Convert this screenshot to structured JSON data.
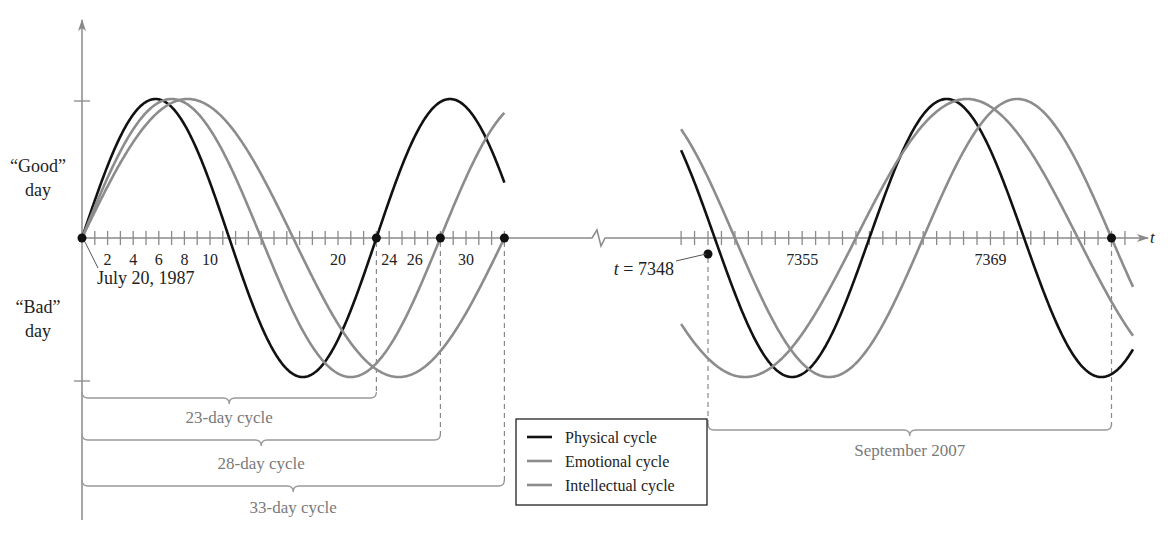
{
  "chart_data": {
    "type": "line",
    "title": "",
    "xlabel": "t",
    "ylabel_top": [
      "“Good”",
      "day"
    ],
    "ylabel_bottom": [
      "“Bad”",
      "day"
    ],
    "y_range": [
      -1,
      1
    ],
    "grid": false,
    "legend_position": "bottom-center",
    "colors": {
      "physical": "#111111",
      "emotional": "#8c8c8c",
      "intellectual": "#8c8c8c",
      "axis": "#8a8a8a"
    },
    "series": [
      {
        "name": "Physical cycle",
        "key": "physical",
        "period": 23,
        "formula": "sin(2*pi*t/23)"
      },
      {
        "name": "Emotional cycle",
        "key": "emotional",
        "period": 28,
        "formula": "sin(2*pi*t/28)"
      },
      {
        "name": "Intellectual cycle",
        "key": "intellectual",
        "period": 33,
        "formula": "sin(2*pi*t/33)"
      }
    ],
    "panels": [
      {
        "name": "birth",
        "x_range": [
          0,
          33
        ],
        "tick_step": 1,
        "tick_labels": [
          {
            "value": 2,
            "label": "2"
          },
          {
            "value": 4,
            "label": "4"
          },
          {
            "value": 6,
            "label": "6"
          },
          {
            "value": 8,
            "label": "8"
          },
          {
            "value": 10,
            "label": "10"
          },
          {
            "value": 20,
            "label": "20"
          },
          {
            "value": 24,
            "label": "24"
          },
          {
            "value": 26,
            "label": "26"
          },
          {
            "value": 30,
            "label": "30"
          }
        ],
        "marked_points": [
          0,
          23,
          28,
          33
        ],
        "annotation": "July 20, 1987",
        "braces": [
          {
            "from": 0,
            "to": 23,
            "label": "23-day cycle"
          },
          {
            "from": 0,
            "to": 28,
            "label": "28-day cycle"
          },
          {
            "from": 0,
            "to": 33,
            "label": "33-day cycle"
          }
        ]
      },
      {
        "name": "september-2007",
        "x_range": [
          7346,
          7379.6
        ],
        "tick_step": 1,
        "tick_labels": [
          {
            "value": 7355,
            "label": "7355"
          },
          {
            "value": 7369,
            "label": "7369"
          }
        ],
        "marked_points": [
          7348,
          7378
        ],
        "annotation": "t = 7348",
        "braces": [
          {
            "from": 7348,
            "to": 7378,
            "label": "September 2007"
          }
        ]
      }
    ]
  }
}
